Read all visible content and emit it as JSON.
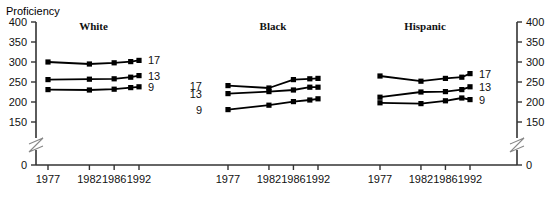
{
  "axis_title": "Proficiency",
  "y_ticks": [
    400,
    350,
    300,
    250,
    200,
    150,
    0
  ],
  "y_ticks_right": [
    400,
    350,
    300,
    250,
    200,
    150,
    0
  ],
  "x_ticks": [
    "1977",
    "1982",
    "1986",
    "1992"
  ],
  "series_labels": [
    "17",
    "13",
    "9"
  ],
  "panels": [
    "White",
    "Black",
    "Hispanic"
  ],
  "colors": {
    "line": "#000000",
    "marker": "#000000",
    "axis": "#444444",
    "background": "#ffffff"
  },
  "chart_data": {
    "type": "line",
    "title": "Proficiency",
    "xlabel": "",
    "ylabel": "Proficiency",
    "ylim": [
      150,
      400
    ],
    "y_axis_break": true,
    "grid": false,
    "legend": "inline-right-of-each-line",
    "x": [
      "1977",
      "1982",
      "1986",
      "1990",
      "1992"
    ],
    "x_tick_labels": [
      "1977",
      "1982",
      "1986",
      "1992"
    ],
    "panels": [
      {
        "name": "White",
        "series": [
          {
            "name": "17",
            "values": [
              300,
              295,
              298,
              301,
              304
            ]
          },
          {
            "name": "13",
            "values": [
              256,
              257,
              258,
              262,
              266
            ]
          },
          {
            "name": "9",
            "values": [
              231,
              230,
              232,
              236,
              238
            ]
          }
        ]
      },
      {
        "name": "Black",
        "series": [
          {
            "name": "17",
            "values": [
              241,
              235,
              256,
              258,
              259
            ]
          },
          {
            "name": "13",
            "values": [
              221,
              226,
              230,
              237,
              237
            ]
          },
          {
            "name": "9",
            "values": [
              181,
              192,
              201,
              205,
              208
            ]
          }
        ]
      },
      {
        "name": "Hispanic",
        "series": [
          {
            "name": "17",
            "values": [
              265,
              252,
              259,
              262,
              271
            ]
          },
          {
            "name": "13",
            "values": [
              212,
              225,
              226,
              231,
              238
            ]
          },
          {
            "name": "9",
            "values": [
              198,
              196,
              203,
              210,
              206
            ]
          }
        ]
      }
    ]
  }
}
